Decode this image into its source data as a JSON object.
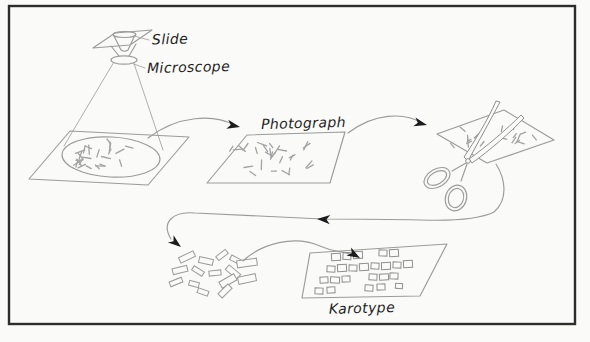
{
  "palette": {
    "paper": "#fafaf8",
    "frame": "#2d2d2d",
    "ink": "#9b9b9b",
    "ink_light": "#aeaeae",
    "marks": "#a3a3a3",
    "arrow": "#1c1c1c",
    "text": "#1e1e1e"
  },
  "labels": {
    "slide": "Slide",
    "microscope": "Microscope",
    "photograph": "Photograph",
    "karotype": "Karotype"
  },
  "drawing": {
    "dash_regions": [
      {
        "target": "g-dash-specimen",
        "cx": 111,
        "cy": 156,
        "rx": 42,
        "ry": 15,
        "count": 26,
        "seed": 11,
        "len": [
          5,
          10
        ]
      },
      {
        "target": "g-dash-photo",
        "cx": 271,
        "cy": 157,
        "rx": 46,
        "ry": 19,
        "count": 27,
        "seed": 23,
        "len": [
          5,
          10
        ]
      },
      {
        "target": "g-dash-scis-left",
        "cx": 469,
        "cy": 139,
        "rx": 20,
        "ry": 12,
        "count": 10,
        "seed": 5,
        "len": [
          4,
          8
        ]
      },
      {
        "target": "g-dash-scis-right",
        "cx": 518,
        "cy": 132,
        "rx": 22,
        "ry": 12,
        "count": 11,
        "seed": 17,
        "len": [
          4,
          8
        ]
      }
    ],
    "cut_pieces": [
      [
        187,
        257,
        16,
        6,
        -25
      ],
      [
        206,
        261,
        14,
        6,
        12
      ],
      [
        222,
        255,
        12,
        5,
        -38
      ],
      [
        236,
        260,
        12,
        5,
        28
      ],
      [
        247,
        263,
        20,
        7,
        -8
      ],
      [
        180,
        270,
        15,
        6,
        -14
      ],
      [
        198,
        271,
        12,
        5,
        32
      ],
      [
        215,
        273,
        12,
        5,
        -6
      ],
      [
        233,
        272,
        15,
        6,
        40
      ],
      [
        176,
        282,
        13,
        5,
        -22
      ],
      [
        194,
        284,
        10,
        5,
        14
      ],
      [
        228,
        281,
        17,
        7,
        -30
      ],
      [
        247,
        279,
        18,
        7,
        -12
      ],
      [
        203,
        292,
        11,
        5,
        20
      ],
      [
        225,
        291,
        14,
        6,
        -45
      ]
    ],
    "karotype_rects": [
      [
        336,
        257,
        9,
        7,
        -4
      ],
      [
        347,
        256,
        8,
        7,
        3
      ],
      [
        358,
        255,
        9,
        7,
        -2
      ],
      [
        383,
        253,
        8,
        6,
        2
      ],
      [
        394,
        253,
        9,
        7,
        -3
      ],
      [
        331,
        269,
        8,
        6,
        3
      ],
      [
        342,
        268,
        9,
        7,
        -3
      ],
      [
        353,
        268,
        8,
        6,
        2
      ],
      [
        364,
        267,
        9,
        7,
        -4
      ],
      [
        375,
        266,
        8,
        6,
        3
      ],
      [
        386,
        266,
        9,
        7,
        -2
      ],
      [
        397,
        265,
        8,
        6,
        2
      ],
      [
        408,
        264,
        9,
        7,
        -3
      ],
      [
        324,
        280,
        8,
        6,
        -3
      ],
      [
        335,
        280,
        9,
        6,
        2
      ],
      [
        346,
        279,
        8,
        6,
        -2
      ],
      [
        373,
        277,
        8,
        6,
        3
      ],
      [
        384,
        277,
        9,
        6,
        -3
      ],
      [
        394,
        276,
        8,
        6,
        2
      ],
      [
        319,
        291,
        8,
        6,
        2
      ],
      [
        331,
        290,
        8,
        6,
        -3
      ],
      [
        369,
        288,
        8,
        6,
        3
      ],
      [
        381,
        287,
        8,
        6,
        -2
      ],
      [
        399,
        286,
        7,
        5,
        3
      ]
    ],
    "arrowheads": [
      {
        "x": 240,
        "y": 127,
        "a": 12
      },
      {
        "x": 427,
        "y": 125,
        "a": 14
      },
      {
        "x": 317,
        "y": 219,
        "a": 183
      },
      {
        "x": 181,
        "y": 247,
        "a": 38
      },
      {
        "x": 360,
        "y": 258,
        "a": 30
      }
    ]
  }
}
